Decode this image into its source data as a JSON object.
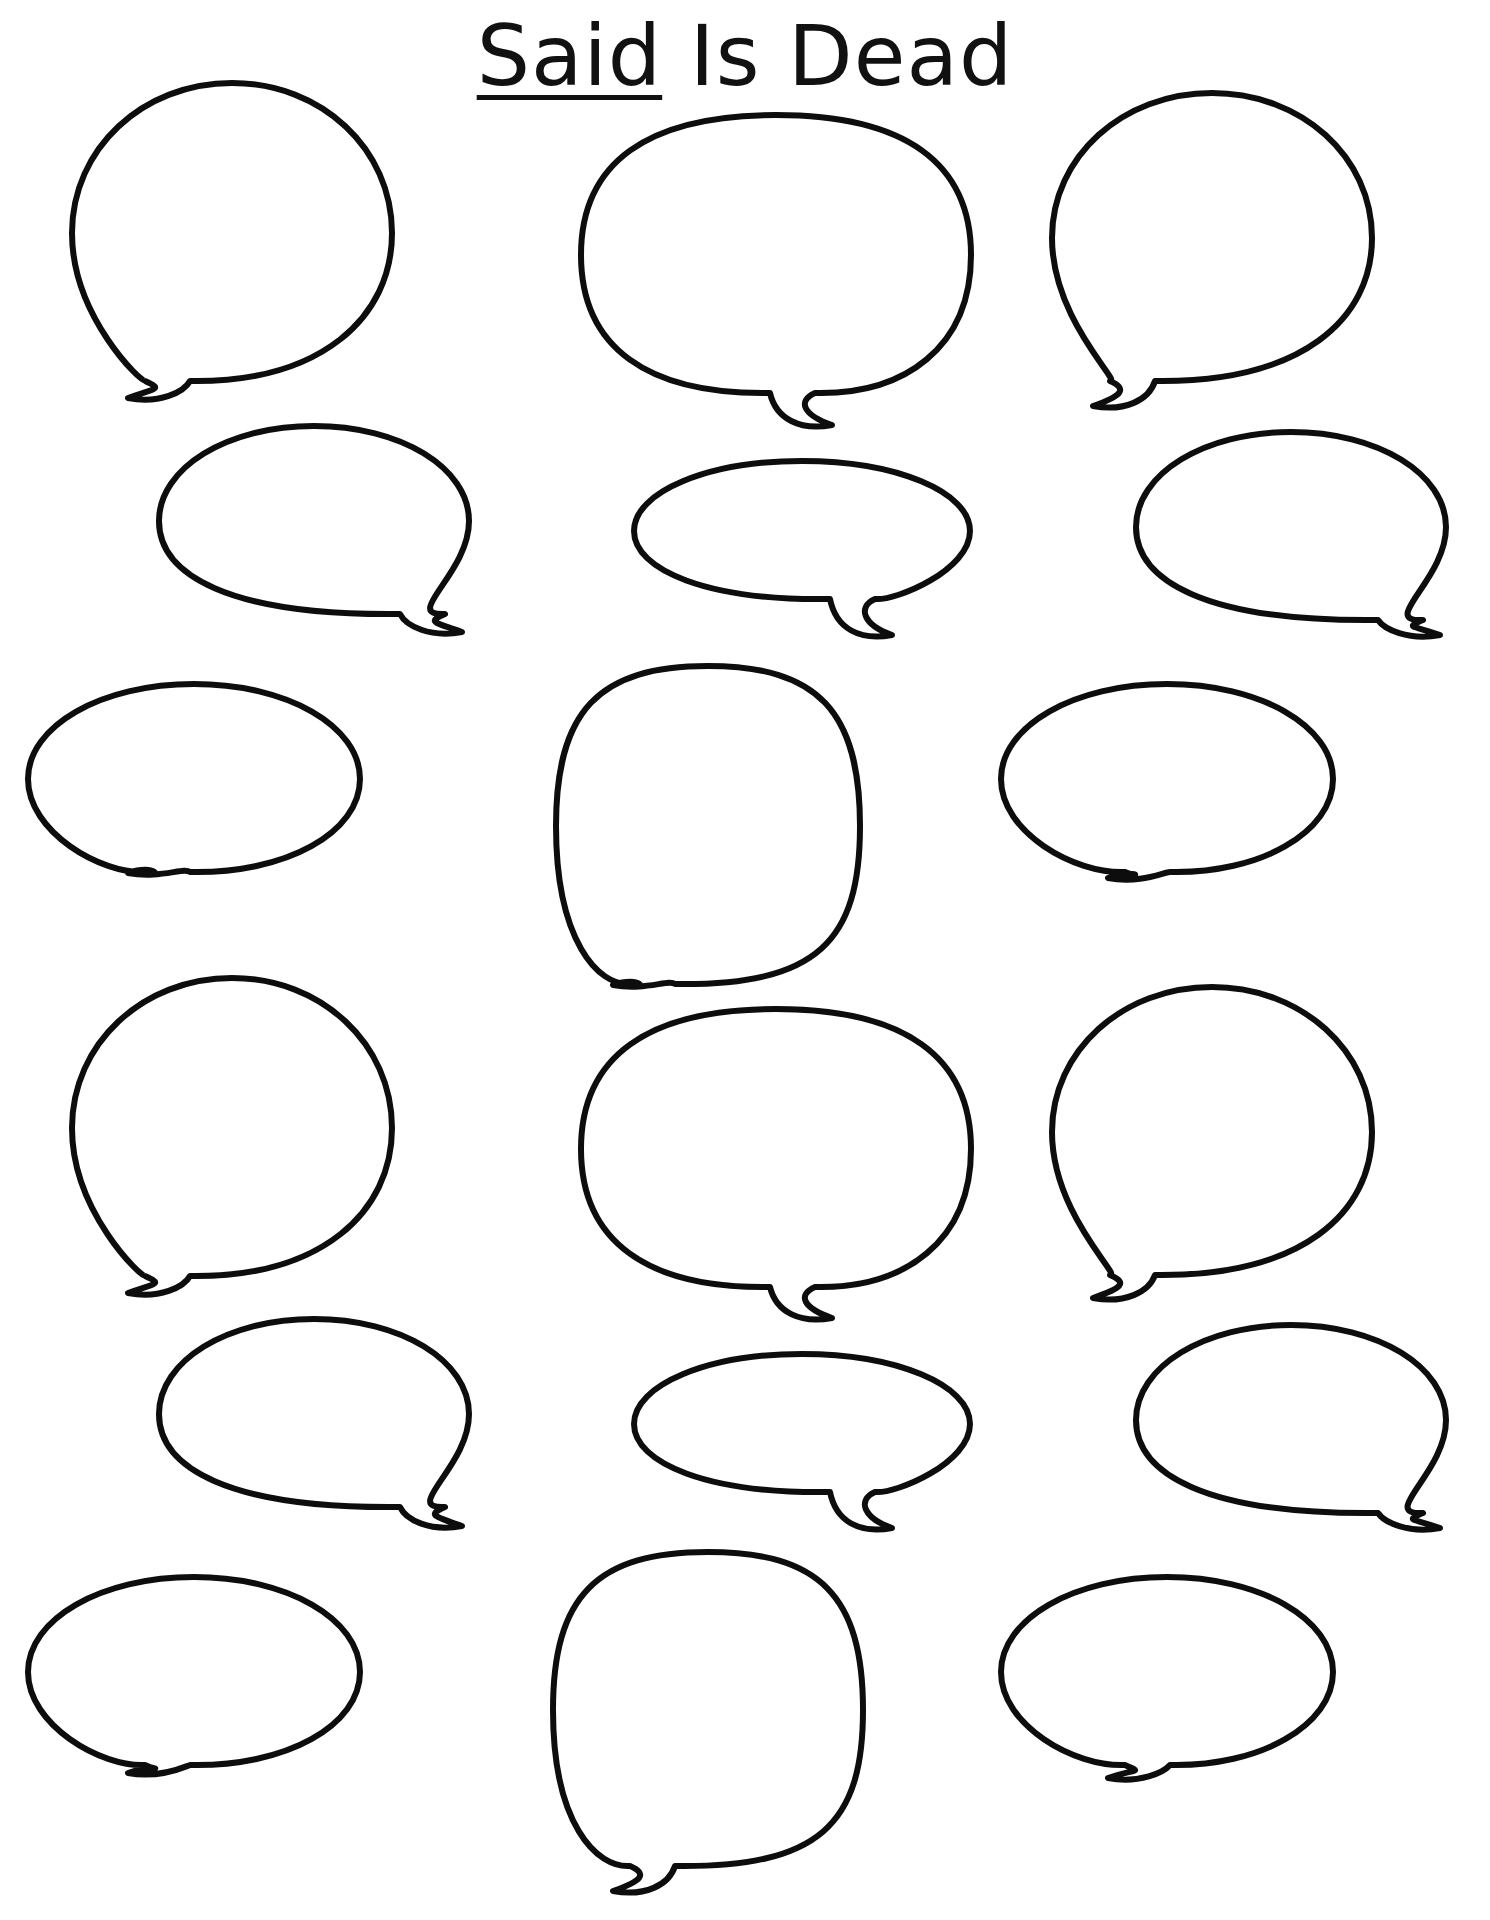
{
  "worksheet": {
    "title_underlined": "Said",
    "title_rest": " Is Dead",
    "line_color": "#0d0d0d",
    "background": "#ffffff",
    "bubble_count": 18,
    "bubbles": [
      {
        "id": 1,
        "shape": "round",
        "cx": 232,
        "cy": 233,
        "rx": 160,
        "ry": 150,
        "tail_x": 150,
        "tail_y": 400,
        "tail_dir": "left"
      },
      {
        "id": 2,
        "shape": "wide-round",
        "cx": 776,
        "cy": 255,
        "rx": 195,
        "ry": 140,
        "tail_x": 810,
        "tail_y": 427,
        "tail_dir": "right"
      },
      {
        "id": 3,
        "shape": "round",
        "cx": 1212,
        "cy": 238,
        "rx": 160,
        "ry": 145,
        "tail_x": 1115,
        "tail_y": 408,
        "tail_dir": "left"
      },
      {
        "id": 4,
        "shape": "oval",
        "cx": 314,
        "cy": 521,
        "rx": 155,
        "ry": 95,
        "tail_x": 440,
        "tail_y": 634,
        "tail_dir": "right"
      },
      {
        "id": 5,
        "shape": "flat-oval",
        "cx": 802,
        "cy": 531,
        "rx": 168,
        "ry": 70,
        "tail_x": 870,
        "tail_y": 637,
        "tail_dir": "right"
      },
      {
        "id": 6,
        "shape": "oval",
        "cx": 1291,
        "cy": 527,
        "rx": 155,
        "ry": 95,
        "tail_x": 1418,
        "tail_y": 637,
        "tail_dir": "right"
      },
      {
        "id": 7,
        "shape": "oval",
        "cx": 194,
        "cy": 779,
        "rx": 166,
        "ry": 95,
        "tail_x": 150,
        "tail_y": 875,
        "tail_dir": "left"
      },
      {
        "id": 8,
        "shape": "tall-round",
        "cx": 708,
        "cy": 826,
        "rx": 152,
        "ry": 160,
        "tail_x": 635,
        "tail_y": 987,
        "tail_dir": "left"
      },
      {
        "id": 9,
        "shape": "oval",
        "cx": 1167,
        "cy": 779,
        "rx": 166,
        "ry": 95,
        "tail_x": 1130,
        "tail_y": 880,
        "tail_dir": "left"
      },
      {
        "id": 10,
        "shape": "round",
        "cx": 232,
        "cy": 1128,
        "rx": 160,
        "ry": 150,
        "tail_x": 150,
        "tail_y": 1295,
        "tail_dir": "left"
      },
      {
        "id": 11,
        "shape": "wide-round",
        "cx": 776,
        "cy": 1149,
        "rx": 195,
        "ry": 140,
        "tail_x": 810,
        "tail_y": 1320,
        "tail_dir": "right"
      },
      {
        "id": 12,
        "shape": "round",
        "cx": 1212,
        "cy": 1132,
        "rx": 160,
        "ry": 145,
        "tail_x": 1115,
        "tail_y": 1300,
        "tail_dir": "left"
      },
      {
        "id": 13,
        "shape": "oval",
        "cx": 314,
        "cy": 1414,
        "rx": 155,
        "ry": 95,
        "tail_x": 440,
        "tail_y": 1528,
        "tail_dir": "right"
      },
      {
        "id": 14,
        "shape": "flat-oval",
        "cx": 802,
        "cy": 1424,
        "rx": 168,
        "ry": 70,
        "tail_x": 870,
        "tail_y": 1530,
        "tail_dir": "right"
      },
      {
        "id": 15,
        "shape": "oval",
        "cx": 1291,
        "cy": 1420,
        "rx": 155,
        "ry": 95,
        "tail_x": 1418,
        "tail_y": 1530,
        "tail_dir": "right"
      },
      {
        "id": 16,
        "shape": "oval",
        "cx": 194,
        "cy": 1672,
        "rx": 166,
        "ry": 95,
        "tail_x": 150,
        "tail_y": 1775,
        "tail_dir": "left"
      },
      {
        "id": 17,
        "shape": "tall-round",
        "cx": 708,
        "cy": 1710,
        "rx": 155,
        "ry": 158,
        "tail_x": 635,
        "tail_y": 1893,
        "tail_dir": "left"
      },
      {
        "id": 18,
        "shape": "oval",
        "cx": 1167,
        "cy": 1672,
        "rx": 166,
        "ry": 95,
        "tail_x": 1130,
        "tail_y": 1780,
        "tail_dir": "left"
      }
    ]
  }
}
